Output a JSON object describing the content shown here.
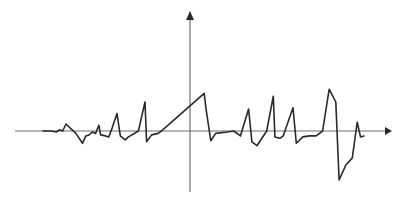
{
  "diagram": {
    "type": "waveform",
    "colors": {
      "axis": "#6e6e6e",
      "trace": "#2a2a2a",
      "background": "#ffffff"
    },
    "trace_points": [
      [
        -1.0,
        0.0
      ],
      [
        -0.95,
        0.0
      ],
      [
        -0.92,
        -0.02
      ],
      [
        -0.9,
        0.02
      ],
      [
        -0.88,
        0.0
      ],
      [
        -0.86,
        0.12
      ],
      [
        -0.8,
        -0.05
      ],
      [
        -0.76,
        -0.25
      ],
      [
        -0.74,
        -0.1
      ],
      [
        -0.72,
        -0.08
      ],
      [
        -0.7,
        -0.02
      ],
      [
        -0.68,
        -0.05
      ],
      [
        -0.66,
        0.1
      ],
      [
        -0.65,
        -0.08
      ],
      [
        -0.62,
        -0.1
      ],
      [
        -0.6,
        -0.12
      ],
      [
        -0.58,
        0.05
      ],
      [
        -0.55,
        0.3
      ],
      [
        -0.53,
        -0.1
      ],
      [
        -0.5,
        -0.18
      ],
      [
        -0.48,
        -0.12
      ],
      [
        -0.42,
        0.0
      ],
      [
        -0.38,
        0.5
      ],
      [
        -0.37,
        -0.22
      ],
      [
        -0.34,
        -0.08
      ],
      [
        -0.3,
        -0.05
      ],
      [
        -0.28,
        0.0
      ],
      [
        -0.26,
        0.05
      ],
      [
        -0.02,
        0.65
      ],
      [
        -0.01,
        0.4
      ],
      [
        0.02,
        -0.2
      ],
      [
        0.05,
        -0.05
      ],
      [
        0.12,
        -0.02
      ],
      [
        0.16,
        0.0
      ],
      [
        0.2,
        -0.1
      ],
      [
        0.25,
        0.38
      ],
      [
        0.27,
        -0.22
      ],
      [
        0.3,
        -0.3
      ],
      [
        0.36,
        0.0
      ],
      [
        0.4,
        0.6
      ],
      [
        0.41,
        -0.12
      ],
      [
        0.44,
        -0.15
      ],
      [
        0.46,
        -0.1
      ],
      [
        0.52,
        0.4
      ],
      [
        0.54,
        -0.25
      ],
      [
        0.58,
        -0.12
      ],
      [
        0.62,
        -0.1
      ],
      [
        0.66,
        -0.1
      ],
      [
        0.7,
        0.0
      ],
      [
        0.74,
        0.72
      ],
      [
        0.78,
        0.5
      ],
      [
        0.8,
        -1.0
      ],
      [
        0.84,
        -0.7
      ],
      [
        0.88,
        -0.55
      ],
      [
        0.91,
        0.15
      ],
      [
        0.93,
        -0.12
      ],
      [
        0.95,
        -0.1
      ]
    ],
    "x_range": [
      -1,
      1
    ],
    "y_range": [
      -1,
      1
    ]
  }
}
